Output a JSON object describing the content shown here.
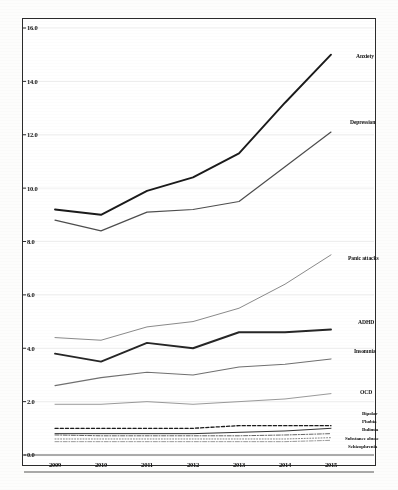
{
  "figure": {
    "background_color": "#ffffff",
    "frame_color": "#2b2b2b",
    "grid_color": "#dcdcdc"
  },
  "axes": {
    "y_ticks": [
      "0.0",
      "2.0",
      "4.0",
      "6.0",
      "8.0",
      "10.0",
      "12.0",
      "14.0",
      "16.0"
    ],
    "x_ticks": [
      "2009",
      "2010",
      "2011",
      "2012",
      "2013",
      "2014",
      "2015"
    ]
  },
  "labels": {
    "anxiety": "Anxiety",
    "depression": "Depression",
    "panic_attacks": "Panic attacks",
    "adhd": "ADHD",
    "insomnia": "Insomnia",
    "ocd": "OCD",
    "bipolar": "Bipolar",
    "phobia": "Phobia",
    "bulimia": "Bulimia",
    "substance_abuse": "Substance abuse",
    "schizophrenia": "Schizophrenia"
  },
  "chart_data": {
    "type": "line",
    "title": "",
    "subtitle": "",
    "xlabel": "",
    "ylabel": "",
    "x": [
      "2009",
      "2010",
      "2011",
      "2012",
      "2013",
      "2014",
      "2015"
    ],
    "xlim": [
      "2009",
      "2015"
    ],
    "ylim": [
      0.0,
      16.0
    ],
    "ytick_step": 2.0,
    "grid": true,
    "grid_axis": "y",
    "legend": "right-inline-labels",
    "series": [
      {
        "name": "Anxiety",
        "color": "#1a1a1a",
        "width": 1.9,
        "dash": "solid",
        "values": [
          9.2,
          9.0,
          9.9,
          10.4,
          11.3,
          13.2,
          15.0
        ]
      },
      {
        "name": "Depression",
        "color": "#4d4d4d",
        "width": 1.2,
        "dash": "solid",
        "values": [
          8.8,
          8.4,
          9.1,
          9.2,
          9.5,
          10.8,
          12.1
        ]
      },
      {
        "name": "Panic attacks",
        "color": "#8a8a8a",
        "width": 1.0,
        "dash": "solid",
        "values": [
          4.4,
          4.3,
          4.8,
          5.0,
          5.5,
          6.4,
          7.5
        ]
      },
      {
        "name": "ADHD",
        "color": "#262626",
        "width": 1.9,
        "dash": "solid",
        "values": [
          3.8,
          3.5,
          4.2,
          4.0,
          4.6,
          4.6,
          4.7
        ]
      },
      {
        "name": "Insomnia",
        "color": "#707070",
        "width": 1.1,
        "dash": "solid",
        "values": [
          2.6,
          2.9,
          3.1,
          3.0,
          3.3,
          3.4,
          3.6
        ]
      },
      {
        "name": "OCD",
        "color": "#9a9a9a",
        "width": 1.0,
        "dash": "solid",
        "values": [
          1.9,
          1.9,
          2.0,
          1.9,
          2.0,
          2.1,
          2.3
        ]
      },
      {
        "name": "Bipolar",
        "color": "#1a1a1a",
        "width": 1.3,
        "dash": "dashed",
        "values": [
          1.0,
          1.0,
          1.0,
          1.0,
          1.1,
          1.1,
          1.1
        ]
      },
      {
        "name": "Phobia",
        "color": "#333333",
        "width": 1.0,
        "dash": "solid",
        "values": [
          0.8,
          0.8,
          0.8,
          0.8,
          0.85,
          0.9,
          1.0
        ]
      },
      {
        "name": "Bulimia",
        "color": "#555555",
        "width": 0.9,
        "dash": "dashdot",
        "values": [
          0.75,
          0.72,
          0.72,
          0.72,
          0.72,
          0.75,
          0.8
        ]
      },
      {
        "name": "Substance abuse",
        "color": "#777777",
        "width": 0.9,
        "dash": "dotted",
        "values": [
          0.6,
          0.6,
          0.6,
          0.6,
          0.6,
          0.6,
          0.65
        ]
      },
      {
        "name": "Schizophrenia",
        "color": "#8f8f8f",
        "width": 0.9,
        "dash": "dashdot",
        "values": [
          0.5,
          0.5,
          0.5,
          0.5,
          0.5,
          0.5,
          0.55
        ]
      }
    ]
  }
}
